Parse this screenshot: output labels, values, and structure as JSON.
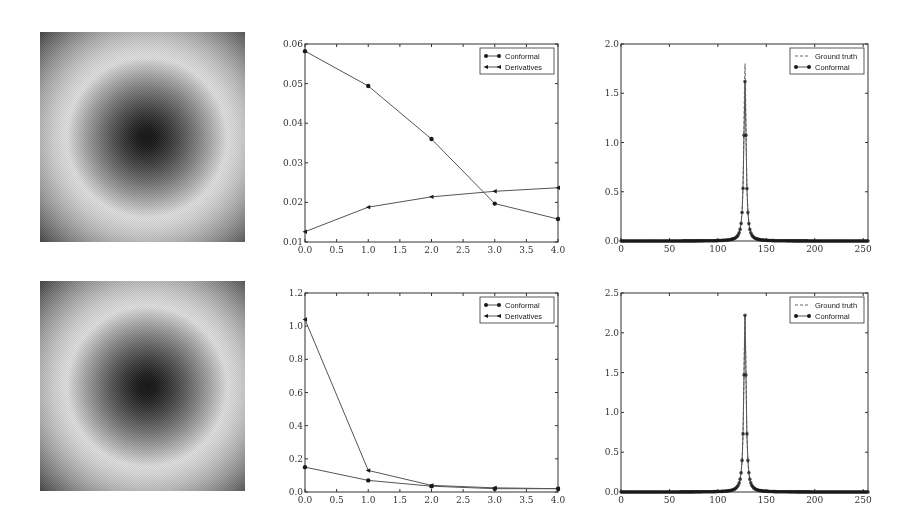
{
  "figure": {
    "rows": 2,
    "columns": 3
  },
  "images": [
    {
      "name": "field-image-top",
      "description": "grayscale radial field: dark center, bright ring, dark corners"
    },
    {
      "name": "field-image-bottom",
      "description": "grayscale radial field: dark center, bright ring, dark corners"
    }
  ],
  "chart_data": [
    {
      "id": "error-top",
      "type": "line",
      "x": [
        0.0,
        1.0,
        2.0,
        3.0,
        4.0
      ],
      "series": [
        {
          "name": "Conformal",
          "marker": "circle",
          "values": [
            0.0582,
            0.0494,
            0.036,
            0.0197,
            0.0158
          ]
        },
        {
          "name": "Derivatives",
          "marker": "triangle-left",
          "values": [
            0.0126,
            0.0188,
            0.0214,
            0.0228,
            0.0237
          ]
        }
      ],
      "title": "",
      "xlabel": "",
      "ylabel": "",
      "xlim": [
        0.0,
        4.0
      ],
      "ylim": [
        0.01,
        0.06
      ],
      "xticks": [
        "0.0",
        "0.5",
        "1.0",
        "1.5",
        "2.0",
        "2.5",
        "3.0",
        "3.5",
        "4.0"
      ],
      "yticks": [
        "0.01",
        "0.02",
        "0.03",
        "0.04",
        "0.05",
        "0.06"
      ],
      "legend_position": "upper right",
      "grid": false
    },
    {
      "id": "profile-top",
      "type": "line",
      "x_range": [
        0,
        255
      ],
      "peak_x": 128,
      "series": [
        {
          "name": "Ground truth",
          "style": "dashed",
          "peak": 1.8
        },
        {
          "name": "Conformal",
          "marker": "circle",
          "peak": 1.62,
          "sample_points": [
            [
              120,
              0.1
            ],
            [
              123,
              0.18
            ],
            [
              125,
              0.31
            ],
            [
              126,
              0.44
            ],
            [
              127,
              0.72
            ],
            [
              128,
              1.62
            ],
            [
              129,
              0.72
            ],
            [
              130,
              0.44
            ],
            [
              131,
              0.31
            ],
            [
              133,
              0.18
            ],
            [
              136,
              0.1
            ]
          ]
        }
      ],
      "title": "",
      "xlabel": "",
      "ylabel": "",
      "xlim": [
        0,
        255
      ],
      "ylim": [
        0.0,
        2.0
      ],
      "xticks": [
        "0",
        "50",
        "100",
        "150",
        "200",
        "250"
      ],
      "yticks": [
        "0.0",
        "0.5",
        "1.0",
        "1.5",
        "2.0"
      ],
      "legend_position": "upper right",
      "grid": false
    },
    {
      "id": "error-bottom",
      "type": "line",
      "x": [
        0.0,
        1.0,
        2.0,
        3.0,
        4.0
      ],
      "series": [
        {
          "name": "Conformal",
          "marker": "circle",
          "values": [
            0.15,
            0.07,
            0.035,
            0.02,
            0.02
          ]
        },
        {
          "name": "Derivatives",
          "marker": "triangle-left",
          "values": [
            1.04,
            0.13,
            0.04,
            0.025,
            0.02
          ]
        }
      ],
      "title": "",
      "xlabel": "",
      "ylabel": "",
      "xlim": [
        0.0,
        4.0
      ],
      "ylim": [
        0.0,
        1.2
      ],
      "xticks": [
        "0.0",
        "0.5",
        "1.0",
        "1.5",
        "2.0",
        "2.5",
        "3.0",
        "3.5",
        "4.0"
      ],
      "yticks": [
        "0.0",
        "0.2",
        "0.4",
        "0.6",
        "0.8",
        "1.0",
        "1.2"
      ],
      "legend_position": "upper right",
      "grid": false
    },
    {
      "id": "profile-bottom",
      "type": "line",
      "x_range": [
        0,
        255
      ],
      "peak_x": 128,
      "series": [
        {
          "name": "Ground truth",
          "style": "dashed",
          "peak": 2.22
        },
        {
          "name": "Conformal",
          "marker": "circle",
          "peak": 2.22,
          "sample_points": [
            [
              120,
              0.15
            ],
            [
              123,
              0.3
            ],
            [
              125,
              0.45
            ],
            [
              126,
              0.6
            ],
            [
              127,
              0.98
            ],
            [
              128,
              2.22
            ],
            [
              129,
              1.02
            ],
            [
              130,
              0.62
            ],
            [
              131,
              0.46
            ],
            [
              133,
              0.3
            ],
            [
              136,
              0.15
            ]
          ]
        }
      ],
      "title": "",
      "xlabel": "",
      "ylabel": "",
      "xlim": [
        0,
        255
      ],
      "ylim": [
        0.0,
        2.5
      ],
      "xticks": [
        "0",
        "50",
        "100",
        "150",
        "200",
        "250"
      ],
      "yticks": [
        "0.0",
        "0.5",
        "1.0",
        "1.5",
        "2.0",
        "2.5"
      ],
      "legend_position": "upper right",
      "grid": false
    }
  ],
  "colors": {
    "axis": "#333333",
    "line": "#555555",
    "marker": "#1a1a1a",
    "tick_text": "#333333"
  }
}
